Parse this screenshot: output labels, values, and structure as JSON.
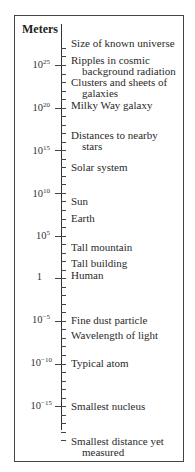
{
  "chart_data": {
    "type": "table",
    "title": "Meters",
    "axis_unit": "Meters",
    "scale": "logarithmic",
    "axis_range_exponents": [
      -20,
      27
    ],
    "major_ticks": [
      {
        "base": "10",
        "exp": "25",
        "value": 25
      },
      {
        "base": "10",
        "exp": "20",
        "value": 20
      },
      {
        "base": "10",
        "exp": "15",
        "value": 15
      },
      {
        "base": "10",
        "exp": "10",
        "value": 10
      },
      {
        "base": "10",
        "exp": "5",
        "value": 5
      },
      {
        "base": "1",
        "exp": "",
        "value": 0
      },
      {
        "base": "10",
        "exp": "−5",
        "value": -5
      },
      {
        "base": "10",
        "exp": "−10",
        "value": -10
      },
      {
        "base": "10",
        "exp": "−15",
        "value": -15
      }
    ],
    "entries": [
      {
        "lines": [
          "Size of known universe"
        ],
        "log10_m": 26
      },
      {
        "lines": [
          "Ripples in cosmic",
          "background radiation"
        ],
        "log10_m": 25
      },
      {
        "lines": [
          "Clusters and sheets of",
          "galaxies"
        ],
        "log10_m": 23
      },
      {
        "lines": [
          "Milky Way galaxy"
        ],
        "log10_m": 21
      },
      {
        "lines": [
          "Distances to nearby",
          "stars"
        ],
        "log10_m": 17
      },
      {
        "lines": [
          "Solar system"
        ],
        "log10_m": 13
      },
      {
        "lines": [
          "Sun"
        ],
        "log10_m": 9
      },
      {
        "lines": [
          "Earth"
        ],
        "log10_m": 7
      },
      {
        "lines": [
          "Tall mountain"
        ],
        "log10_m": 4
      },
      {
        "lines": [
          "Tall building"
        ],
        "log10_m": 2
      },
      {
        "lines": [
          "Human"
        ],
        "log10_m": 0
      },
      {
        "lines": [
          "Fine dust particle"
        ],
        "log10_m": -5
      },
      {
        "lines": [
          "Wavelength of light"
        ],
        "log10_m": -6
      },
      {
        "lines": [
          "Typical atom"
        ],
        "log10_m": -10
      },
      {
        "lines": [
          "Smallest nucleus"
        ],
        "log10_m": -15
      },
      {
        "lines": [
          "Smallest distance yet",
          "measured"
        ],
        "log10_m": -19
      }
    ]
  },
  "diagram": {
    "unit_label": "Meters",
    "ticks": {
      "t25": {
        "base": "10",
        "exp": "25"
      },
      "t20": {
        "base": "10",
        "exp": "20"
      },
      "t15": {
        "base": "10",
        "exp": "15"
      },
      "t10": {
        "base": "10",
        "exp": "10"
      },
      "t5": {
        "base": "10",
        "exp": "5"
      },
      "t0": {
        "base": "1",
        "exp": ""
      },
      "tm5": {
        "base": "10",
        "exp": "−5"
      },
      "tm10": {
        "base": "10",
        "exp": "−10"
      },
      "tm15": {
        "base": "10",
        "exp": "−15"
      }
    },
    "labels": {
      "universe": {
        "l1": "Size of known universe"
      },
      "ripples": {
        "l1": "Ripples in cosmic",
        "l2": "background radiation"
      },
      "clusters": {
        "l1": "Clusters and sheets of",
        "l2": "galaxies"
      },
      "milky_way": {
        "l1": "Milky Way galaxy"
      },
      "stars": {
        "l1": "Distances to nearby",
        "l2": "stars"
      },
      "solar": {
        "l1": "Solar system"
      },
      "sun": {
        "l1": "Sun"
      },
      "earth": {
        "l1": "Earth"
      },
      "mountain": {
        "l1": "Tall mountain"
      },
      "building": {
        "l1": "Tall building"
      },
      "human": {
        "l1": "Human"
      },
      "dust": {
        "l1": "Fine dust particle"
      },
      "light": {
        "l1": "Wavelength of light"
      },
      "atom": {
        "l1": "Typical atom"
      },
      "nucleus": {
        "l1": "Smallest nucleus"
      },
      "smallest": {
        "l1": "Smallest distance yet",
        "l2": "measured"
      }
    }
  }
}
